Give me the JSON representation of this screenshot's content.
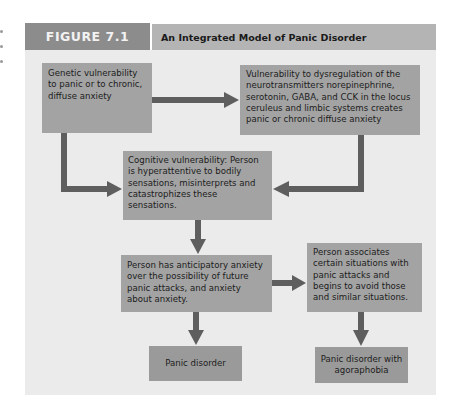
{
  "figure": {
    "label": "FIGURE 7.1",
    "title": "An Integrated Model of Panic Disorder"
  },
  "colors": {
    "label_bg": "#8c8c8c",
    "title_bg": "#b4b4b4",
    "panel_bg": "#ebebeb",
    "box_bg": "#a3a3a3",
    "arrow": "#5e5e5e"
  },
  "nodes": {
    "genetic": "Genetic vulnerability to panic or to chronic, diffuse anxiety",
    "neuro": "Vulnerability to dysregulation of the neurotransmitters norepinephrine, serotonin, GABA, and CCK in the locus ceruleus and limbic systems creates panic or chronic diffuse anxiety",
    "cognitive": "Cognitive vulnerability: Person is hyperattentive to bodily sensations, misinterprets and catastrophizes these sensations.",
    "anticipatory": "Person has anticipatory anxiety over the possibility of future panic attacks, and anxiety about anxiety.",
    "associates": "Person associates certain situations with panic attacks and begins to avoid those and similar situations.",
    "panic_disorder": "Panic disorder",
    "agoraphobia": "Panic disorder with agoraphobia"
  },
  "edges": [
    {
      "from": "genetic",
      "to": "neuro"
    },
    {
      "from": "genetic",
      "to": "cognitive"
    },
    {
      "from": "neuro",
      "to": "cognitive"
    },
    {
      "from": "cognitive",
      "to": "anticipatory"
    },
    {
      "from": "anticipatory",
      "to": "associates"
    },
    {
      "from": "anticipatory",
      "to": "panic_disorder"
    },
    {
      "from": "associates",
      "to": "agoraphobia"
    }
  ]
}
